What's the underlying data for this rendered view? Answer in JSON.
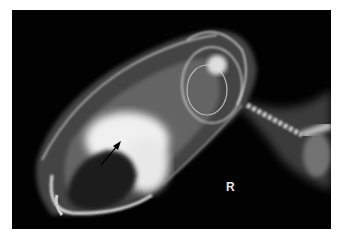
{
  "image": {
    "type": "radiograph",
    "subject": "lateral skull x-ray with cervical spine",
    "marker_label": "R",
    "annotation": "arrow pointing to radiopaque mass",
    "colors": {
      "background": "#ffffff",
      "film": "#020202",
      "bone": "#e8e8e8"
    }
  }
}
